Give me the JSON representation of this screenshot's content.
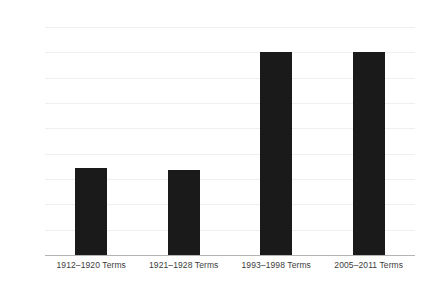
{
  "chart_data": {
    "type": "bar",
    "title": "",
    "subtitle": "",
    "xlabel": "",
    "ylabel": "",
    "categories": [
      "1912–1920 Terms",
      "1921–1928 Terms",
      "1993–1998 Terms",
      "2005–2011 Terms"
    ],
    "values": [
      6.9,
      6.75,
      16.0,
      16.0
    ],
    "series": [
      {
        "name": "",
        "values": [
          6.9,
          6.75,
          16.0,
          16.0
        ]
      }
    ],
    "ylim": [
      0,
      18
    ],
    "ytick_step": 2,
    "ytick_labels": [
      "0.00",
      "2.00",
      "4.00",
      "6.00",
      "8.00",
      "10.00",
      "12.00",
      "14.00",
      "16.00",
      "18.00"
    ],
    "ytick_values": [
      0,
      2,
      4,
      6,
      8,
      10,
      12,
      14,
      16,
      18
    ],
    "grid": true,
    "grid_axis": "y",
    "legend": false,
    "legend_position": "none",
    "bar_color": "#1a1a1a",
    "gridline_color": "#efefef",
    "axis_color": "#b4b4b4",
    "background_color": "#ffffff",
    "text_color": "#3c3c3c"
  }
}
